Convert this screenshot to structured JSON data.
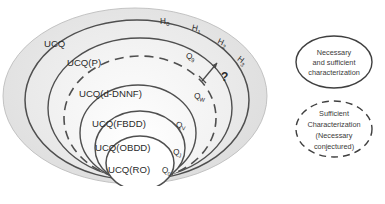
{
  "diagram": {
    "title_present": false,
    "type": "nested-set-venn-diagram",
    "sets": [
      {
        "id": "ucq",
        "label": "UCQ",
        "style": "solid"
      },
      {
        "id": "ucq_p",
        "label": "UCQ(P)",
        "style": "solid"
      },
      {
        "id": "ucq_dnnf",
        "label": "UCQ(d-DNNF)",
        "style": "dashed"
      },
      {
        "id": "ucq_fbdd",
        "label": "UCQ(FBDD)",
        "style": "solid"
      },
      {
        "id": "ucq_obdd",
        "label": "UCQ(OBDD)",
        "style": "solid"
      },
      {
        "id": "ucq_ro",
        "label": "UCQ(RO)",
        "style": "solid"
      }
    ],
    "query_points": [
      {
        "id": "q9",
        "base": "Q",
        "sub": "9"
      },
      {
        "id": "qw",
        "base": "Q",
        "sub": "W"
      },
      {
        "id": "qv",
        "base": "Q",
        "sub": "V"
      },
      {
        "id": "qj",
        "base": "Q",
        "sub": "J"
      },
      {
        "id": "q0",
        "base": "Q",
        "sub": "0"
      }
    ],
    "hierarchy_points": [
      {
        "id": "h0",
        "base": "H",
        "sub": "0"
      },
      {
        "id": "h1",
        "base": "H",
        "sub": "1"
      },
      {
        "id": "h2",
        "base": "H",
        "sub": "2"
      },
      {
        "id": "h3",
        "base": "H",
        "sub": "3"
      }
    ],
    "annotation": {
      "id": "question-mark",
      "label": "?"
    },
    "colors": {
      "stroke": "#555555",
      "fill_outer": "#e3e3e3",
      "fill_inner": "#f7f7f7",
      "text": "#2b2b2b"
    }
  },
  "legend": {
    "items": [
      {
        "id": "legend-solid",
        "style": "solid",
        "lines": [
          "Necessary",
          "and sufficient",
          "characterization"
        ]
      },
      {
        "id": "legend-dashed",
        "style": "dashed",
        "lines": [
          "Sufficient",
          "Characterization",
          "(Necessary",
          "conjectured)"
        ]
      }
    ]
  }
}
